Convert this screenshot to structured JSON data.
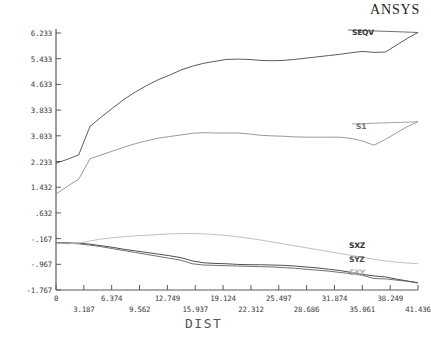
{
  "brand": {
    "title": "ANSYS"
  },
  "chart_data": {
    "type": "line",
    "title": "",
    "xlabel": "DIST",
    "ylabel": "",
    "xlim": [
      0,
      41.436
    ],
    "ylim": [
      -1.767,
      6.233
    ],
    "grid": false,
    "legend_position": "right-inline",
    "xticks": [
      0,
      3.187,
      6.374,
      9.562,
      12.749,
      15.937,
      19.124,
      22.312,
      25.497,
      28.686,
      31.874,
      35.061,
      38.249,
      41.436
    ],
    "xtick_labels": [
      "0",
      "3.187",
      "6.374",
      "9.562",
      "12.749",
      "15.937",
      "19.124",
      "22.312",
      "25.497",
      "28.686",
      "31.874",
      "35.061",
      "38.249",
      "41.436"
    ],
    "xtick_rows": [
      0,
      1,
      0,
      1,
      0,
      1,
      0,
      1,
      0,
      1,
      0,
      1,
      0,
      1
    ],
    "yticks": [
      -1.767,
      -0.967,
      -0.167,
      0.632,
      1.432,
      2.233,
      3.033,
      3.833,
      4.633,
      5.433,
      6.233
    ],
    "ytick_labels": [
      "-1.767",
      "-.967",
      "-.167",
      ".632",
      "1.432",
      "2.233",
      "3.033",
      "3.833",
      "4.633",
      "5.433",
      "6.233"
    ],
    "x": [
      0,
      1.3,
      2.6,
      3.9,
      5.2,
      6.5,
      7.8,
      9.1,
      10.4,
      11.7,
      13.0,
      14.3,
      15.6,
      16.9,
      18.2,
      19.5,
      20.8,
      22.1,
      23.4,
      24.7,
      26.0,
      27.3,
      28.6,
      29.9,
      31.2,
      32.5,
      33.8,
      35.1,
      36.4,
      37.7,
      39.0,
      40.3,
      41.436
    ],
    "series": [
      {
        "name": "SEQV",
        "color": "#4a4a4a",
        "label_color": "#3a3a3a",
        "values": [
          2.18,
          2.3,
          2.44,
          3.33,
          3.62,
          3.9,
          4.17,
          4.4,
          4.6,
          4.78,
          4.92,
          5.08,
          5.2,
          5.29,
          5.35,
          5.41,
          5.42,
          5.41,
          5.38,
          5.37,
          5.38,
          5.41,
          5.45,
          5.49,
          5.53,
          5.57,
          5.62,
          5.66,
          5.63,
          5.64,
          5.86,
          6.08,
          6.25
        ]
      },
      {
        "name": "S1",
        "color": "#8d8d8d",
        "label_color": "#6f6f6f",
        "values": [
          1.22,
          1.46,
          1.68,
          2.32,
          2.44,
          2.56,
          2.68,
          2.79,
          2.88,
          2.96,
          3.01,
          3.06,
          3.11,
          3.13,
          3.12,
          3.12,
          3.12,
          3.09,
          3.05,
          3.03,
          3.02,
          3.0,
          2.99,
          2.99,
          2.99,
          2.99,
          2.95,
          2.87,
          2.74,
          2.92,
          3.13,
          3.33,
          3.47
        ]
      },
      {
        "name": "SXZ",
        "color": "#3b3b3b",
        "label_color": "#2e2e2e",
        "values": [
          -0.3,
          -0.3,
          -0.31,
          -0.34,
          -0.39,
          -0.44,
          -0.5,
          -0.55,
          -0.6,
          -0.65,
          -0.7,
          -0.76,
          -0.86,
          -0.92,
          -0.94,
          -0.95,
          -0.97,
          -0.98,
          -0.98,
          -0.99,
          -1.0,
          -1.02,
          -1.05,
          -1.08,
          -1.12,
          -1.16,
          -1.22,
          -1.28,
          -1.33,
          -1.36,
          -1.43,
          -1.49,
          -1.54
        ]
      },
      {
        "name": "SYZ",
        "color": "#606060",
        "label_color": "#444444",
        "values": [
          -0.31,
          -0.31,
          -0.33,
          -0.37,
          -0.42,
          -0.48,
          -0.54,
          -0.6,
          -0.66,
          -0.72,
          -0.78,
          -0.84,
          -0.95,
          -0.99,
          -1.0,
          -1.01,
          -1.02,
          -1.03,
          -1.04,
          -1.05,
          -1.07,
          -1.09,
          -1.12,
          -1.15,
          -1.18,
          -1.22,
          -1.26,
          -1.31,
          -1.41,
          -1.42,
          -1.46,
          -1.5,
          -1.55
        ]
      },
      {
        "name": "SXY",
        "color": "#b9b9b9",
        "label_color": "#b0b0b0",
        "values": [
          -0.31,
          -0.33,
          -0.31,
          -0.24,
          -0.18,
          -0.14,
          -0.11,
          -0.08,
          -0.06,
          -0.04,
          -0.02,
          -0.01,
          -0.01,
          -0.02,
          -0.04,
          -0.07,
          -0.11,
          -0.16,
          -0.21,
          -0.27,
          -0.33,
          -0.39,
          -0.45,
          -0.51,
          -0.57,
          -0.63,
          -0.69,
          -0.75,
          -0.81,
          -0.86,
          -0.9,
          -0.93,
          -0.95
        ]
      }
    ],
    "series_labels": [
      {
        "name": "SEQV",
        "x": 352,
        "y": 28
      },
      {
        "name": "S1",
        "x": 356,
        "y": 122
      },
      {
        "name": "SXZ",
        "x": 349,
        "y": 241
      },
      {
        "name": "SYZ",
        "x": 349,
        "y": 255
      },
      {
        "name": "SXY",
        "x": 349,
        "y": 268
      }
    ]
  }
}
